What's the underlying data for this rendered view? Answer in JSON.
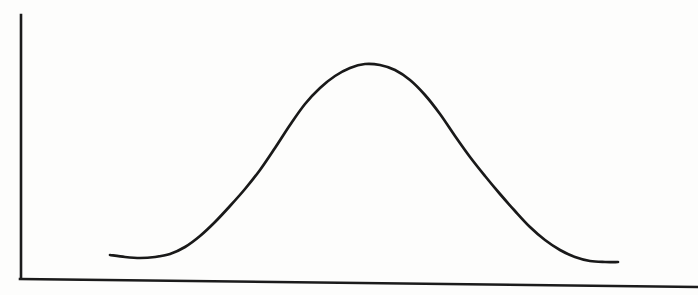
{
  "figure": {
    "name": "bell-curve-figure",
    "background_color": "#fdfdfc",
    "ink_color": "#191919",
    "width": 698,
    "height": 295,
    "title": "",
    "caption": ""
  },
  "axes": {
    "y_axis": {
      "name": "y-axis",
      "label": "",
      "x": 21,
      "y_top": 15,
      "y_bottom": 278,
      "stroke": "#1b1b1b",
      "stroke_width": 2.6,
      "ticks": [],
      "tick_labels": []
    },
    "x_axis": {
      "name": "x-axis",
      "label": "",
      "x_start": 20,
      "y_start": 279,
      "x_end": 698,
      "y_end": 287,
      "stroke": "#1b1b1b",
      "stroke_width": 2.6,
      "ticks": [],
      "tick_labels": []
    }
  },
  "chart_data": {
    "type": "line",
    "title": "",
    "subtitle": "",
    "xlabel": "",
    "ylabel": "",
    "grid": false,
    "legend": [],
    "legend_position": "none",
    "annotations": [],
    "xlim": [
      110,
      618
    ],
    "ylim": [
      64,
      262
    ],
    "series": [
      {
        "name": "bell-curve",
        "stroke": "#191919",
        "stroke_width": 2.7,
        "points": [
          [
            110,
            255
          ],
          [
            125,
            257
          ],
          [
            140,
            258
          ],
          [
            155,
            257
          ],
          [
            170,
            254
          ],
          [
            185,
            247
          ],
          [
            200,
            236
          ],
          [
            215,
            222
          ],
          [
            230,
            206
          ],
          [
            245,
            189
          ],
          [
            260,
            170
          ],
          [
            275,
            148
          ],
          [
            290,
            125
          ],
          [
            305,
            104
          ],
          [
            320,
            88
          ],
          [
            335,
            76
          ],
          [
            350,
            68
          ],
          [
            365,
            64
          ],
          [
            380,
            65
          ],
          [
            395,
            70
          ],
          [
            410,
            80
          ],
          [
            425,
            95
          ],
          [
            440,
            114
          ],
          [
            455,
            136
          ],
          [
            470,
            157
          ],
          [
            485,
            176
          ],
          [
            500,
            194
          ],
          [
            515,
            211
          ],
          [
            530,
            227
          ],
          [
            545,
            240
          ],
          [
            560,
            250
          ],
          [
            575,
            257
          ],
          [
            590,
            261
          ],
          [
            605,
            262
          ],
          [
            618,
            262
          ]
        ],
        "peak": {
          "x": 365,
          "y": 64
        },
        "left_tail_start": {
          "x": 110,
          "y": 255
        },
        "right_tail_end": {
          "x": 618,
          "y": 262
        }
      }
    ]
  }
}
